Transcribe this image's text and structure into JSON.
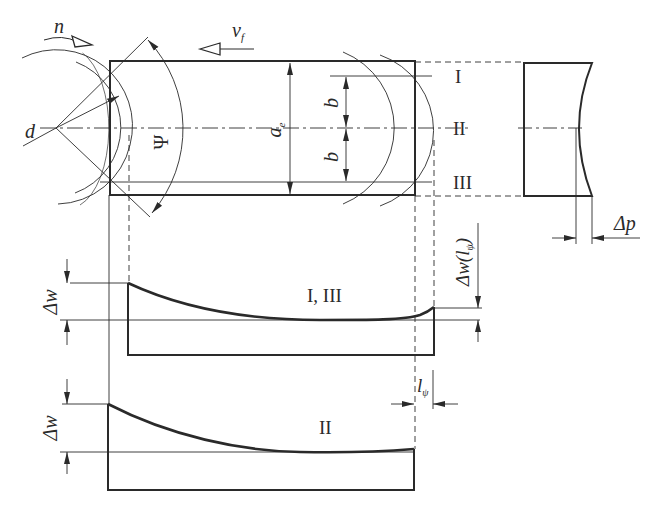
{
  "diagram": {
    "type": "technical-drawing",
    "colors": {
      "line": "#2a2a2a",
      "background": "#ffffff"
    },
    "top_view": {
      "labels": {
        "rotation": "n",
        "feed": "v",
        "feed_sub": "f",
        "diameter": "d",
        "engagement_angle": "Ψ",
        "width_of_cut": "a",
        "width_of_cut_sub": "e",
        "offset_upper": "b",
        "offset_lower": "b"
      },
      "section_lines": [
        "I",
        "II",
        "III"
      ]
    },
    "side_view": {
      "labels": {
        "deviation": "Δp"
      }
    },
    "profile_I_III": {
      "label": "I, III",
      "dim_left": "Δw",
      "dim_right": "Δw(l",
      "dim_right_sub": "ψ",
      "dim_right_close": ")"
    },
    "profile_II": {
      "label": "II",
      "dim_left": "Δw",
      "dim_length": "l",
      "dim_length_sub": "ψ"
    }
  }
}
